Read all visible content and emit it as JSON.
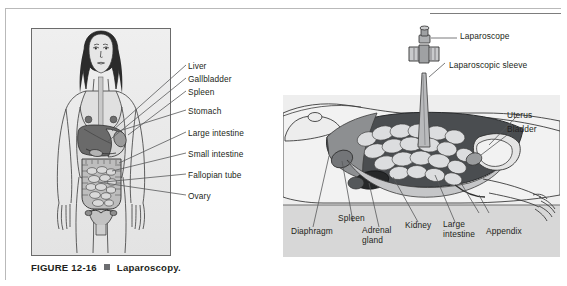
{
  "figure": {
    "number": "FIGURE 12-16",
    "marker": "square-bullet",
    "title": "Laparoscopy."
  },
  "left_panel": {
    "name": "anterior-view-female-abdomen",
    "labels": [
      {
        "id": "liver",
        "text": "Liver"
      },
      {
        "id": "gallbladder",
        "text": "Gallbladder"
      },
      {
        "id": "spleen",
        "text": "Spleen"
      },
      {
        "id": "stomach",
        "text": "Stomach"
      },
      {
        "id": "large-intestine",
        "text": "Large intestine"
      },
      {
        "id": "small-intestine",
        "text": "Small intestine"
      },
      {
        "id": "fallopian-tube",
        "text": "Fallopian tube"
      },
      {
        "id": "ovary",
        "text": "Ovary"
      }
    ]
  },
  "right_panel": {
    "name": "lateral-view-laparoscopy-procedure",
    "labels_top": [
      {
        "id": "laparoscope",
        "text": "Laparoscope"
      },
      {
        "id": "laparoscopic-sleeve",
        "text": "Laparoscopic sleeve"
      },
      {
        "id": "uterus",
        "text": "Uterus"
      },
      {
        "id": "bladder",
        "text": "Bladder"
      }
    ],
    "labels_bottom": [
      {
        "id": "diaphragm",
        "text": "Diaphragm"
      },
      {
        "id": "spleen",
        "text": "Spleen"
      },
      {
        "id": "adrenal-gland",
        "text": "Adrenal\ngland"
      },
      {
        "id": "kidney",
        "text": "Kidney"
      },
      {
        "id": "large-intestine",
        "text": "Large\nintestine"
      },
      {
        "id": "appendix",
        "text": "Appendix"
      }
    ]
  },
  "colors": {
    "ink": "#231f20",
    "panel_bg": "#ebebeb",
    "floor_bg": "#d5d5d5",
    "dark_cavity": "#53565a",
    "mid_gray": "#8a8c8e",
    "light_gray": "#c8c9ca",
    "marker": "#6d6e71"
  }
}
